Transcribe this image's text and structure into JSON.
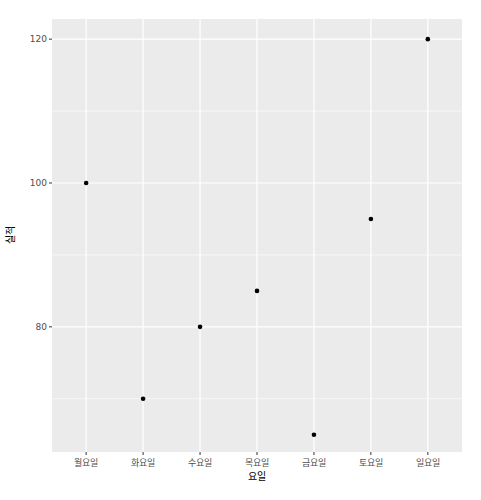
{
  "chart_data": {
    "type": "scatter",
    "title": "",
    "xlabel": "요일",
    "ylabel": "실적",
    "categories": [
      "월요일",
      "화요일",
      "수요일",
      "목요일",
      "금요일",
      "토요일",
      "일요일"
    ],
    "values": [
      100,
      70,
      80,
      85,
      65,
      95,
      120
    ],
    "ylim": [
      62.6,
      122.8
    ],
    "yticks": [
      80,
      100,
      120
    ],
    "yminor": [
      70,
      90,
      110
    ],
    "grid": true,
    "legend": "none",
    "colors": {
      "panel_bg": "#ebebeb",
      "grid": "#ffffff",
      "point": "#000000",
      "tick_text": "#4d4d4d"
    }
  }
}
